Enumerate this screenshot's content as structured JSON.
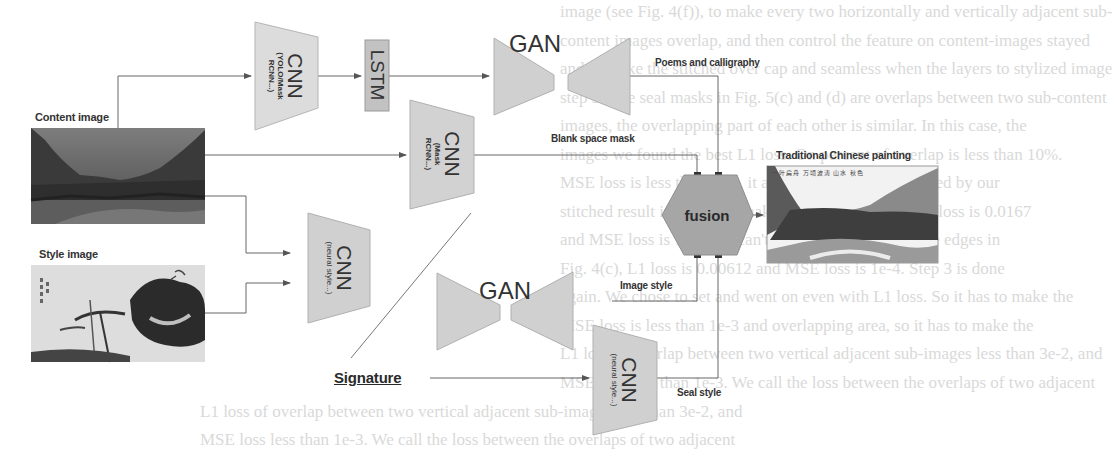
{
  "figure": {
    "inputs": {
      "content_image_label": "Content image",
      "style_image_label": "Style image",
      "signature_label": "Signature"
    },
    "blocks": {
      "cnn_detect": {
        "title": "CNN",
        "subtitle_line1": "(YOLO/Mask",
        "subtitle_line2": "RCNN...)"
      },
      "lstm": {
        "title": "LSTM"
      },
      "gan_top": {
        "title": "GAN"
      },
      "cnn_mask": {
        "title": "CNN",
        "subtitle_line1": "(Mask",
        "subtitle_line2": "RCNN...)"
      },
      "cnn_style": {
        "title": "CNN",
        "subtitle_line1": "(neural style...)"
      },
      "gan_bottom": {
        "title": "GAN"
      },
      "cnn_seal": {
        "title": "CNN",
        "subtitle_line1": "(neural style...)"
      },
      "fusion": {
        "title": "fusion"
      }
    },
    "edge_labels": {
      "poems": "Poems and calligraphy",
      "blank_mask": "Blank space mask",
      "image_style": "Image style",
      "seal_style": "Seal style"
    },
    "output": {
      "label": "Traditional Chinese painting",
      "inscription": "一叶扁舟 万顷波涛 山水 秋色"
    },
    "colors": {
      "block_fill": "#d4d4d4",
      "block_stroke": "#b0b0b0",
      "lstm_fill": "#c4c4c4",
      "fusion_fill": "#a8a8a8",
      "line": "#666666",
      "text": "#333333"
    }
  },
  "background_text": {
    "lines": [
      "image (see Fig. 4(f)), to make every two horizontally and vertically adjacent sub-",
      "content images overlap, and then control the feature on content-images stayed",
      "and to make the stitched over cap and seamless when the layers to stylized image",
      "step 3: The seal masks in Fig. 5(c) and (d) are overlaps between two sub-content",
      "images, the overlapping part of each other is similar. In this case, the",
      "images we found the best L1 loss. On percent of overlap is less than 10%.",
      "MSE loss is less than 1e-3, it always can be distinguished by our",
      "stitched result images with naked eyes. In Fig. 4(a), L1 loss is 0.0167",
      "and MSE loss is 1e-3; we can't see discontinuities at the edges in",
      "Fig. 4(c), L1 loss is 0.00612 and MSE loss is 1e-4. Step 3 is done",
      "again. We chose to set and went on even with L1 loss. So it has to make the",
      "MSE loss is less than 1e-3 and overlapping area, so it has to make the",
      "L1 loss of overlap between two vertical adjacent sub-images less than 3e-2, and",
      "MSE loss less than 1e-3. We call the loss between the overlaps of two adjacent"
    ]
  }
}
